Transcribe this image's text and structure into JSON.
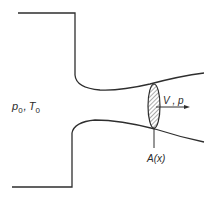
{
  "diagram": {
    "reservoir_label": {
      "main1": "p",
      "sub1": "0",
      "sep": ",",
      "main2": "T",
      "sub2": "0"
    },
    "flow_label": "V , p",
    "area_label": "A(x)",
    "colors": {
      "stroke": "#2e2e2e",
      "background": "#ffffff"
    }
  }
}
